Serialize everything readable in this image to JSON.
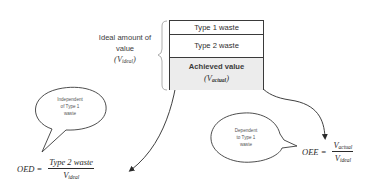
{
  "box": {
    "rows": [
      {
        "label": "Type 1 waste"
      },
      {
        "label": "Type 2 waste"
      },
      {
        "label": "Achieved value",
        "symbol_base": "V",
        "symbol_sub": "actual"
      }
    ],
    "colors": {
      "border": "#3a3a3a",
      "achieved_fill": "#ececec"
    }
  },
  "ideal_brace_label": {
    "line1": "Ideal amount of",
    "line2": "value",
    "symbol_base": "V",
    "symbol_sub": "ideal"
  },
  "bubbles": {
    "left": {
      "line1": "Independent",
      "line2": "of Type 1",
      "line3": "waste"
    },
    "right": {
      "line1": "Dependent",
      "line2": "to Type 1",
      "line3": "waste"
    }
  },
  "formulas": {
    "oed": {
      "lhs": "OED =",
      "numerator": "Type 2 waste",
      "denominator_base": "V",
      "denominator_sub": "ideal"
    },
    "oee": {
      "lhs": "OEE =",
      "numerator_base": "V",
      "numerator_sub": "actual",
      "denominator_base": "V",
      "denominator_sub": "ideal"
    }
  },
  "arrows": [
    {
      "from": "Type 2 waste",
      "to": "OED formula"
    },
    {
      "from": "Achieved value",
      "to": "OEE formula"
    }
  ]
}
